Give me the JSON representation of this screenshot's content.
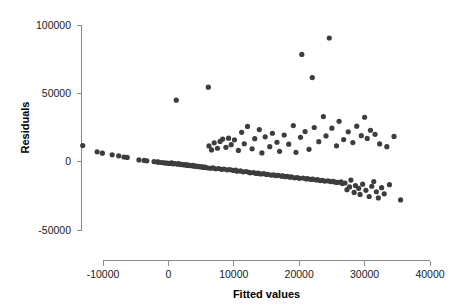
{
  "chart_data": {
    "type": "scatter",
    "title": "",
    "xlabel": "Fitted values",
    "ylabel": "Residuals",
    "xlim": [
      -14500,
      42500
    ],
    "ylim": [
      -57000,
      107000
    ],
    "grid": false,
    "legend": null,
    "point_color": "#3d3d3d",
    "point_radius": 2.6,
    "axis_color": "#8a8a8a",
    "x_ticks": [
      -10000,
      0,
      10000,
      20000,
      30000,
      40000
    ],
    "x_tick_labels": [
      "-10000",
      "0",
      "10000",
      "20000",
      "30000",
      "40000"
    ],
    "y_ticks": [
      -50000,
      0,
      50000,
      100000
    ],
    "y_tick_labels": [
      "-50000",
      "0",
      "50000",
      "100000"
    ],
    "points": [
      [
        -13100,
        11800
      ],
      [
        -10900,
        7200
      ],
      [
        -10100,
        6200
      ],
      [
        -8600,
        5000
      ],
      [
        -7600,
        4300
      ],
      [
        -6800,
        3400
      ],
      [
        -6300,
        3100
      ],
      [
        -4500,
        1300
      ],
      [
        -3700,
        900
      ],
      [
        -3300,
        600
      ],
      [
        -2200,
        100
      ],
      [
        -1700,
        -200
      ],
      [
        -1500,
        -400
      ],
      [
        -1000,
        -600
      ],
      [
        -600,
        -900
      ],
      [
        -200,
        -1100
      ],
      [
        200,
        -1300
      ],
      [
        500,
        -900
      ],
      [
        700,
        -1600
      ],
      [
        1000,
        -1400
      ],
      [
        1200,
        45000
      ],
      [
        1400,
        -1800
      ],
      [
        1600,
        -1500
      ],
      [
        1900,
        -2100
      ],
      [
        2100,
        -1900
      ],
      [
        2400,
        -2400
      ],
      [
        2700,
        -2200
      ],
      [
        2900,
        -2800
      ],
      [
        3100,
        -2500
      ],
      [
        3400,
        -3000
      ],
      [
        3700,
        -2700
      ],
      [
        3900,
        -3300
      ],
      [
        4100,
        -3100
      ],
      [
        4400,
        -3600
      ],
      [
        4600,
        -3400
      ],
      [
        4900,
        -3900
      ],
      [
        5100,
        -3700
      ],
      [
        5400,
        -4200
      ],
      [
        5600,
        -4000
      ],
      [
        5900,
        -4500
      ],
      [
        6100,
        54500
      ],
      [
        6200,
        11500
      ],
      [
        6400,
        -4800
      ],
      [
        6600,
        8600
      ],
      [
        6800,
        -4600
      ],
      [
        7000,
        13800
      ],
      [
        7200,
        -5200
      ],
      [
        7500,
        9800
      ],
      [
        7700,
        -5000
      ],
      [
        7900,
        14800
      ],
      [
        8100,
        -5600
      ],
      [
        8300,
        16500
      ],
      [
        8500,
        -5400
      ],
      [
        8800,
        10500
      ],
      [
        9000,
        -6000
      ],
      [
        9200,
        17200
      ],
      [
        9400,
        -5800
      ],
      [
        9600,
        12400
      ],
      [
        9900,
        -6400
      ],
      [
        10100,
        16000
      ],
      [
        10300,
        -6200
      ],
      [
        10500,
        -7000
      ],
      [
        10700,
        8200
      ],
      [
        11000,
        -6800
      ],
      [
        11200,
        21500
      ],
      [
        11400,
        -7400
      ],
      [
        11600,
        13100
      ],
      [
        11900,
        -7200
      ],
      [
        12100,
        25800
      ],
      [
        12300,
        -7800
      ],
      [
        12500,
        -8200
      ],
      [
        12800,
        9400
      ],
      [
        13000,
        -8000
      ],
      [
        13200,
        16800
      ],
      [
        13400,
        -8600
      ],
      [
        13700,
        -8400
      ],
      [
        13900,
        23500
      ],
      [
        14100,
        -9000
      ],
      [
        14300,
        6400
      ],
      [
        14600,
        -8800
      ],
      [
        14800,
        18200
      ],
      [
        15000,
        -9400
      ],
      [
        15200,
        -9200
      ],
      [
        15500,
        11000
      ],
      [
        15700,
        -9800
      ],
      [
        15900,
        20800
      ],
      [
        16100,
        -9600
      ],
      [
        16400,
        -10200
      ],
      [
        16600,
        14200
      ],
      [
        16800,
        -10000
      ],
      [
        17000,
        7600
      ],
      [
        17300,
        -10600
      ],
      [
        17500,
        -10400
      ],
      [
        17700,
        19500
      ],
      [
        17900,
        -11000
      ],
      [
        18200,
        -10800
      ],
      [
        18400,
        12800
      ],
      [
        18600,
        -11400
      ],
      [
        18800,
        -11200
      ],
      [
        19100,
        26400
      ],
      [
        19300,
        -11800
      ],
      [
        19500,
        6800
      ],
      [
        19700,
        -11600
      ],
      [
        20000,
        -12200
      ],
      [
        20200,
        17800
      ],
      [
        20400,
        78500
      ],
      [
        20600,
        -12000
      ],
      [
        20900,
        22000
      ],
      [
        21100,
        -12600
      ],
      [
        21300,
        -12400
      ],
      [
        21500,
        9000
      ],
      [
        21800,
        -13000
      ],
      [
        22000,
        61500
      ],
      [
        22100,
        -12800
      ],
      [
        22300,
        25000
      ],
      [
        22600,
        -13400
      ],
      [
        22800,
        -13200
      ],
      [
        23000,
        14600
      ],
      [
        23200,
        -13800
      ],
      [
        23500,
        -13600
      ],
      [
        23700,
        33000
      ],
      [
        23900,
        -14200
      ],
      [
        24100,
        18800
      ],
      [
        24400,
        -14000
      ],
      [
        24600,
        90500
      ],
      [
        24800,
        -14600
      ],
      [
        25000,
        24500
      ],
      [
        25200,
        -14400
      ],
      [
        25500,
        -15000
      ],
      [
        25700,
        11600
      ],
      [
        25900,
        -15200
      ],
      [
        26100,
        29500
      ],
      [
        26400,
        -14800
      ],
      [
        26600,
        -16000
      ],
      [
        26800,
        16200
      ],
      [
        27000,
        -15600
      ],
      [
        27300,
        -20500
      ],
      [
        27500,
        21800
      ],
      [
        27700,
        -18500
      ],
      [
        27900,
        -13500
      ],
      [
        28200,
        14000
      ],
      [
        28400,
        -22500
      ],
      [
        28600,
        -17500
      ],
      [
        28800,
        26000
      ],
      [
        29100,
        -19500
      ],
      [
        29300,
        -24000
      ],
      [
        29500,
        19000
      ],
      [
        29700,
        -16500
      ],
      [
        30000,
        32500
      ],
      [
        30200,
        -21000
      ],
      [
        30400,
        17000
      ],
      [
        30700,
        -25500
      ],
      [
        30900,
        23000
      ],
      [
        31100,
        -18000
      ],
      [
        31400,
        -14500
      ],
      [
        31600,
        20000
      ],
      [
        31800,
        -22000
      ],
      [
        32100,
        -26500
      ],
      [
        32300,
        13000
      ],
      [
        32600,
        -19000
      ],
      [
        33000,
        -23500
      ],
      [
        33400,
        11000
      ],
      [
        33800,
        -16800
      ],
      [
        34500,
        18500
      ],
      [
        35500,
        -28000
      ]
    ]
  }
}
